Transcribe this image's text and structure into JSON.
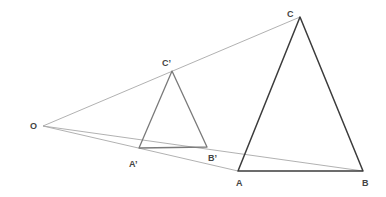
{
  "diagram": {
    "colors": {
      "ray": "#a8a8a8",
      "small_triangle": "#7a7a7a",
      "large_triangle": "#3c3c3c",
      "label": "#444444"
    },
    "points": {
      "O": {
        "label": "O",
        "x": 43,
        "y": 126,
        "lx": 30,
        "ly": 129
      },
      "A": {
        "label": "A",
        "x": 238,
        "y": 171,
        "lx": 236,
        "ly": 186
      },
      "B": {
        "label": "B",
        "x": 363,
        "y": 171,
        "lx": 362,
        "ly": 186
      },
      "C": {
        "label": "C",
        "x": 300,
        "y": 17,
        "lx": 287,
        "ly": 17
      },
      "A1": {
        "label": "A’",
        "x": 139,
        "y": 148,
        "lx": 129,
        "ly": 167
      },
      "B1": {
        "label": "B’",
        "x": 207,
        "y": 147,
        "lx": 208,
        "ly": 161
      },
      "C1": {
        "label": "C’",
        "x": 172,
        "y": 71,
        "lx": 162,
        "ly": 66
      }
    },
    "rays": [
      {
        "from": "O",
        "to": "C"
      },
      {
        "from": "O",
        "to": "A"
      },
      {
        "from": "O",
        "to": "B"
      }
    ],
    "triangles": [
      {
        "name": "A'B'C'",
        "vertices": [
          "A1",
          "B1",
          "C1"
        ]
      },
      {
        "name": "ABC",
        "vertices": [
          "A",
          "B",
          "C"
        ]
      }
    ]
  }
}
